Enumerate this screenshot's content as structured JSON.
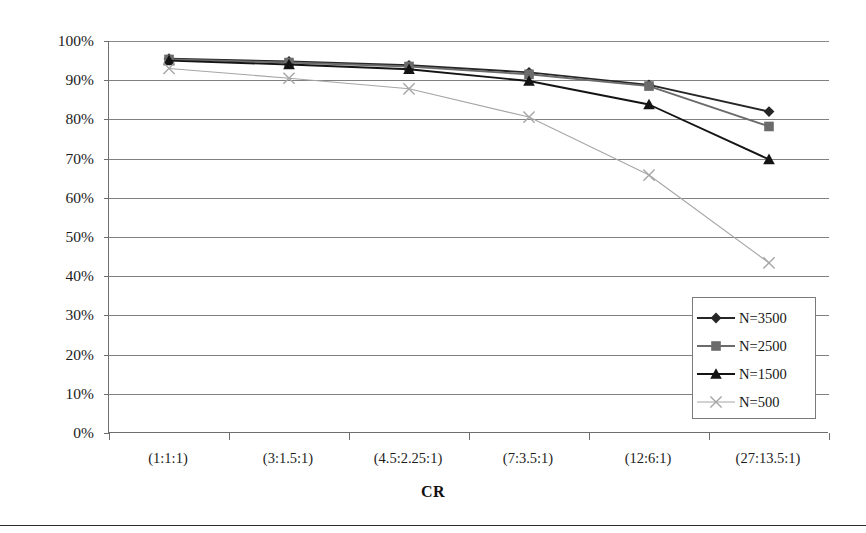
{
  "chart_data": {
    "type": "line",
    "title": "",
    "xlabel": "CR",
    "ylabel": "",
    "categories": [
      "(1:1:1)",
      "(3:1.5:1)",
      "(4.5:2.25:1)",
      "(7:3.5:1)",
      "(12:6:1)",
      "(27:13.5:1)"
    ],
    "ytick_labels": [
      "100%",
      "90%",
      "80%",
      "70%",
      "60%",
      "50%",
      "40%",
      "30%",
      "20%",
      "10%",
      "0%"
    ],
    "ytick_values": [
      100,
      90,
      80,
      70,
      60,
      50,
      40,
      30,
      20,
      10,
      0
    ],
    "ylim": [
      0,
      100
    ],
    "y_unit": "%",
    "grid": "horizontal",
    "legend_position": "bottom-right-inside",
    "series": [
      {
        "name": "N=3500",
        "marker": "diamond",
        "color": "#262626",
        "values": [
          95.5,
          94.8,
          93.8,
          92.0,
          88.8,
          82.0
        ]
      },
      {
        "name": "N=2500",
        "marker": "square",
        "color": "#6b6b6b",
        "values": [
          95.3,
          94.5,
          93.5,
          91.5,
          88.5,
          78.2
        ]
      },
      {
        "name": "N=1500",
        "marker": "triangle",
        "color": "#141414",
        "values": [
          95.0,
          94.0,
          92.8,
          89.8,
          83.8,
          69.8
        ]
      },
      {
        "name": "N=500",
        "marker": "x",
        "color": "#a6a6a6",
        "values": [
          93.0,
          90.5,
          87.8,
          80.6,
          65.8,
          43.4
        ]
      }
    ]
  },
  "figure": {
    "axis_title": "CR"
  }
}
